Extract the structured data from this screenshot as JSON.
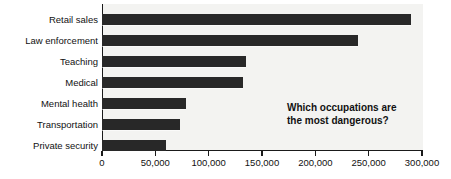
{
  "annotation": {
    "line1": "Which occupations are",
    "line2": "the most dangerous?"
  },
  "axis": {
    "x_tick_labels": [
      "0",
      "50,000",
      "100,000",
      "150,000",
      "200,000",
      "250,000",
      "300,000"
    ]
  },
  "colors": {
    "bar": "#282828",
    "plot_background": "#f3f3f1",
    "axis": "#1a1a1a",
    "text": "#111111",
    "page_background": "#ffffff"
  },
  "chart_data": {
    "type": "bar",
    "orientation": "horizontal",
    "title": "",
    "subtitle": "",
    "xlabel": "",
    "ylabel": "",
    "xlim": [
      0,
      300000
    ],
    "xticks": [
      0,
      50000,
      100000,
      150000,
      200000,
      250000,
      300000
    ],
    "grid": false,
    "legend": false,
    "annotations": [
      "Which occupations are the most dangerous?"
    ],
    "categories": [
      "Retail sales",
      "Law enforcement",
      "Teaching",
      "Medical",
      "Mental health",
      "Transportation",
      "Private security"
    ],
    "values": [
      290000,
      240000,
      135000,
      132000,
      79000,
      73000,
      60000
    ]
  }
}
